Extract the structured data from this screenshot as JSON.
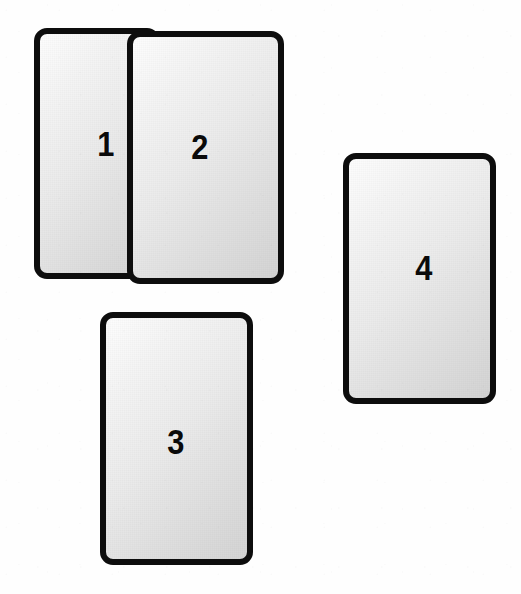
{
  "diagram": {
    "background_color": "#fefefe",
    "card_border_color": "#0d0d0d",
    "card_fill_light": "#fdfdfd",
    "card_fill_dark": "#d4d4d4",
    "label_color": "#0a0a0a",
    "cards": [
      {
        "id": "card-1",
        "label": "1",
        "x": 34,
        "y": 28,
        "width": 126,
        "height": 251,
        "z": 1,
        "label_x": 96,
        "label_y": 126,
        "stacking": "behind"
      },
      {
        "id": "card-2",
        "label": "2",
        "x": 127,
        "y": 31,
        "width": 157,
        "height": 253,
        "z": 2,
        "label_x": 190,
        "label_y": 129,
        "stacking": "front"
      },
      {
        "id": "card-3",
        "label": "3",
        "x": 100,
        "y": 312,
        "width": 153,
        "height": 253,
        "z": 1,
        "label_x": 166,
        "label_y": 424,
        "stacking": "separate"
      },
      {
        "id": "card-4",
        "label": "4",
        "x": 343,
        "y": 153,
        "width": 153,
        "height": 251,
        "z": 1,
        "label_x": 414,
        "label_y": 250,
        "stacking": "separate"
      }
    ]
  }
}
